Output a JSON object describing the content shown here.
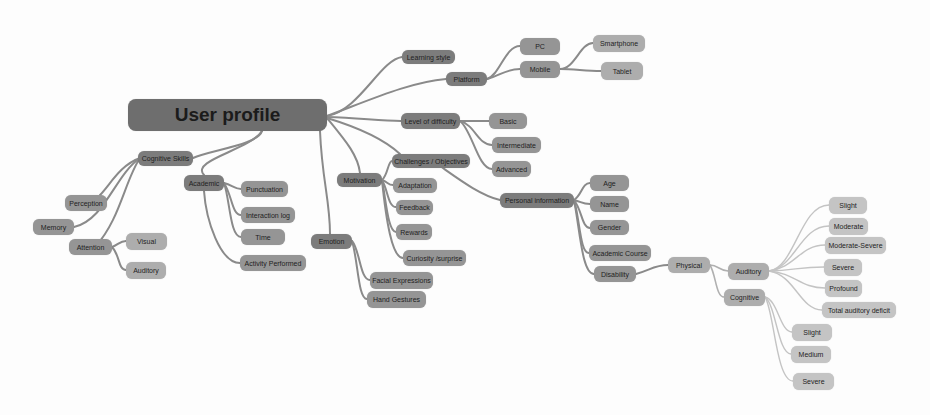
{
  "diagram": {
    "type": "mind-map",
    "root": {
      "id": "user-profile",
      "label": "User profile"
    },
    "nodes": {
      "cognitive_skills": "Cognitive Skills",
      "perception": "Perception",
      "memory": "Memory",
      "attention": "Attention",
      "visual": "Visual",
      "attention_auditory": "Auditory",
      "academic": "Academic",
      "punctuation": "Punctuation",
      "interaction_log": "Interaction log",
      "time": "Time",
      "activity_performed": "Activity Performed",
      "emotion": "Emotion",
      "facial_expressions": "Facial Expressions",
      "hand_gestures": "Hand Gestures",
      "motivation": "Motivation",
      "challenges_objectives": "Challenges / Objectives",
      "adaptation": "Adaptation",
      "feedback": "Feedback",
      "rewards": "Rewards",
      "curiosity_surprise": "Curiosity /surprise",
      "learning_style": "Learning style",
      "platform": "Platform",
      "pc": "PC",
      "mobile": "Mobile",
      "smartphone": "Smartphone",
      "tablet": "Tablet",
      "level_of_difficulty": "Level of difficulty",
      "basic": "Basic",
      "intermediate": "Intermediate",
      "advanced": "Advanced",
      "personal_information": "Personal information",
      "age": "Age",
      "name": "Name",
      "gender": "Gender",
      "academic_course": "Academic Course",
      "disability": "Disability",
      "physical": "Physical",
      "physical_auditory": "Auditory",
      "physical_cognitive": "Cognitive",
      "aud_slight": "Slight",
      "aud_moderate": "Moderate",
      "aud_moderate_severe": "Moderate-Severe",
      "aud_severe": "Severe",
      "aud_profound": "Profound",
      "aud_total_deficit": "Total auditory deficit",
      "cog_slight": "Slight",
      "cog_medium": "Medium",
      "cog_severe": "Severe"
    },
    "edges": [
      [
        "user-profile",
        "cognitive_skills"
      ],
      [
        "user-profile",
        "academic"
      ],
      [
        "user-profile",
        "emotion"
      ],
      [
        "user-profile",
        "motivation"
      ],
      [
        "user-profile",
        "challenges_objectives"
      ],
      [
        "user-profile",
        "learning_style"
      ],
      [
        "user-profile",
        "platform"
      ],
      [
        "user-profile",
        "level_of_difficulty"
      ],
      [
        "user-profile",
        "personal_information"
      ],
      [
        "cognitive_skills",
        "perception"
      ],
      [
        "cognitive_skills",
        "memory"
      ],
      [
        "cognitive_skills",
        "attention"
      ],
      [
        "attention",
        "visual"
      ],
      [
        "attention",
        "attention_auditory"
      ],
      [
        "academic",
        "punctuation"
      ],
      [
        "academic",
        "interaction_log"
      ],
      [
        "academic",
        "time"
      ],
      [
        "academic",
        "activity_performed"
      ],
      [
        "emotion",
        "facial_expressions"
      ],
      [
        "emotion",
        "hand_gestures"
      ],
      [
        "motivation",
        "challenges_objectives"
      ],
      [
        "motivation",
        "adaptation"
      ],
      [
        "motivation",
        "feedback"
      ],
      [
        "motivation",
        "rewards"
      ],
      [
        "motivation",
        "curiosity_surprise"
      ],
      [
        "platform",
        "pc"
      ],
      [
        "platform",
        "mobile"
      ],
      [
        "mobile",
        "smartphone"
      ],
      [
        "mobile",
        "tablet"
      ],
      [
        "level_of_difficulty",
        "basic"
      ],
      [
        "level_of_difficulty",
        "intermediate"
      ],
      [
        "level_of_difficulty",
        "advanced"
      ],
      [
        "personal_information",
        "age"
      ],
      [
        "personal_information",
        "name"
      ],
      [
        "personal_information",
        "gender"
      ],
      [
        "personal_information",
        "academic_course"
      ],
      [
        "personal_information",
        "disability"
      ],
      [
        "disability",
        "physical"
      ],
      [
        "physical",
        "physical_auditory"
      ],
      [
        "physical",
        "physical_cognitive"
      ],
      [
        "physical_auditory",
        "aud_slight"
      ],
      [
        "physical_auditory",
        "aud_moderate"
      ],
      [
        "physical_auditory",
        "aud_moderate_severe"
      ],
      [
        "physical_auditory",
        "aud_severe"
      ],
      [
        "physical_auditory",
        "aud_profound"
      ],
      [
        "physical_auditory",
        "aud_total_deficit"
      ],
      [
        "physical_cognitive",
        "cog_slight"
      ],
      [
        "physical_cognitive",
        "cog_medium"
      ],
      [
        "physical_cognitive",
        "cog_severe"
      ]
    ]
  }
}
